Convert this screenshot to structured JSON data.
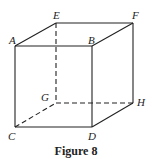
{
  "figure": {
    "caption": "Figure 8",
    "type": "cube",
    "vertices": [
      {
        "name": "A",
        "x": 15,
        "y": 46,
        "lx": 7,
        "ly": 41
      },
      {
        "name": "B",
        "x": 92,
        "y": 46,
        "lx": 88,
        "ly": 41
      },
      {
        "name": "E",
        "x": 56,
        "y": 23,
        "lx": 53,
        "ly": 18
      },
      {
        "name": "F",
        "x": 133,
        "y": 23,
        "lx": 131,
        "ly": 18
      },
      {
        "name": "C",
        "x": 15,
        "y": 127,
        "lx": 8,
        "ly": 137
      },
      {
        "name": "D",
        "x": 92,
        "y": 127,
        "lx": 88,
        "ly": 137
      },
      {
        "name": "G",
        "x": 56,
        "y": 103,
        "lx": 41,
        "ly": 101
      },
      {
        "name": "H",
        "x": 133,
        "y": 103,
        "lx": 137,
        "ly": 104
      }
    ],
    "solid_edges": [
      "AB",
      "AE",
      "EF",
      "BF",
      "AC",
      "BD",
      "CD",
      "DH",
      "FH"
    ],
    "dashed_edges": [
      "EG",
      "CG",
      "GH"
    ]
  }
}
